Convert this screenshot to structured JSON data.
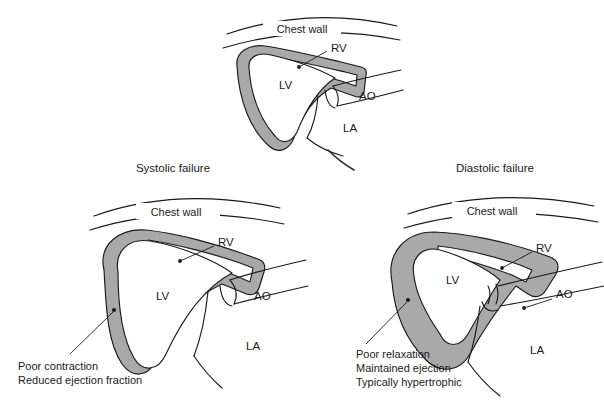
{
  "figure": {
    "background_color": "#ffffff",
    "ink_color": "#1a1a1a",
    "myocardium_color": "#a9a9a9",
    "cavity_color": "#ffffff"
  },
  "panels": [
    {
      "id": "normal",
      "title": "",
      "chest_wall_label": "Chest wall",
      "chambers": [
        {
          "key": "rv",
          "label": "RV"
        },
        {
          "key": "lv",
          "label": "LV"
        },
        {
          "key": "ao",
          "label": "AO"
        },
        {
          "key": "la",
          "label": "LA"
        }
      ],
      "notes": []
    },
    {
      "id": "systolic",
      "title": "Systolic failure",
      "chest_wall_label": "Chest wall",
      "chambers": [
        {
          "key": "rv",
          "label": "RV"
        },
        {
          "key": "lv",
          "label": "LV"
        },
        {
          "key": "ao",
          "label": "AO"
        },
        {
          "key": "la",
          "label": "LA"
        }
      ],
      "notes": [
        "Poor contraction",
        "Reduced ejection fraction"
      ]
    },
    {
      "id": "diastolic",
      "title": "Diastolic failure",
      "chest_wall_label": "Chest wall",
      "chambers": [
        {
          "key": "rv",
          "label": "RV"
        },
        {
          "key": "lv",
          "label": "LV"
        },
        {
          "key": "ao",
          "label": "AO"
        },
        {
          "key": "la",
          "label": "LA"
        }
      ],
      "notes": [
        "Poor relaxation",
        "Maintained ejection",
        "Typically hypertrophic"
      ]
    }
  ]
}
